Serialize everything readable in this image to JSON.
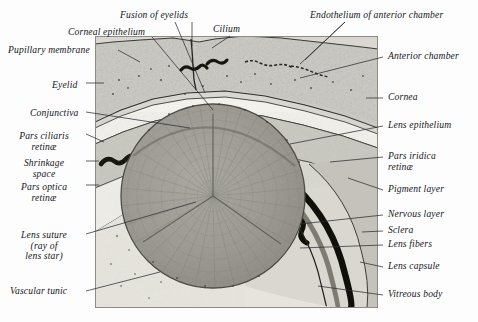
{
  "plate": {
    "title": "Sagittal section through the eye of a human fetus",
    "artist_signature": "Katherine Hilb"
  },
  "labels_left": [
    {
      "id": "pupillary-membrane",
      "text": "Pupillary membrane",
      "x": 8,
      "y": 45
    },
    {
      "id": "eyelid",
      "text": "Eyelid",
      "x": 52,
      "y": 80
    },
    {
      "id": "conjunctiva",
      "text": "Conjunctiva",
      "x": 30,
      "y": 108
    },
    {
      "id": "pars-ciliaris-retinae",
      "text": "Pars ciliaris\nretinæ",
      "x": 22,
      "y": 131
    },
    {
      "id": "shrinkage-space",
      "text": "Shrinkage\nspace",
      "x": 28,
      "y": 158
    },
    {
      "id": "pars-optica-retinae",
      "text": "Pars optica\nretinæ",
      "x": 22,
      "y": 182
    },
    {
      "id": "lens-suture",
      "text": "Lens suture\n(ray of\nlens star)",
      "x": 22,
      "y": 230
    },
    {
      "id": "vascular-tunic",
      "text": "Vascular tunic",
      "x": 10,
      "y": 288
    }
  ],
  "labels_top": [
    {
      "id": "fusion-of-eyelids",
      "text": "Fusion of eyelids",
      "x": 120,
      "y": 10
    },
    {
      "id": "corneal-epithelium",
      "text": "Corneal epithelium",
      "x": 68,
      "y": 27
    },
    {
      "id": "cilium",
      "text": "Cilium",
      "x": 213,
      "y": 24
    },
    {
      "id": "endothelium-of-anterior-chamber",
      "text": "Endothelium of anterior chamber",
      "x": 310,
      "y": 10
    }
  ],
  "labels_right": [
    {
      "id": "anterior-chamber",
      "text": "Anterior chamber",
      "x": 386,
      "y": 54
    },
    {
      "id": "cornea",
      "text": "Cornea",
      "x": 386,
      "y": 95
    },
    {
      "id": "lens-epithelium",
      "text": "Lens epithelium",
      "x": 386,
      "y": 123
    },
    {
      "id": "pars-iridica-retinae",
      "text": "Pars iridica\nretinæ",
      "x": 386,
      "y": 154
    },
    {
      "id": "pigment-layer",
      "text": "Pigment layer",
      "x": 386,
      "y": 187
    },
    {
      "id": "nervous-layer",
      "text": "Nervous layer",
      "x": 386,
      "y": 212
    },
    {
      "id": "sclera",
      "text": "Sclera",
      "x": 386,
      "y": 228
    },
    {
      "id": "lens-fibers",
      "text": "Lens fibers",
      "x": 386,
      "y": 242
    },
    {
      "id": "lens-capsule",
      "text": "Lens capsule",
      "x": 386,
      "y": 264
    },
    {
      "id": "vitreous-body",
      "text": "Vitreous body",
      "x": 386,
      "y": 292
    }
  ],
  "colors": {
    "ink": "#15171c",
    "leader": "#32343a",
    "tissue": "#cfcdc6",
    "lens": "#9a9890",
    "pigment": "#14140f",
    "page": "#fdfdfd"
  }
}
